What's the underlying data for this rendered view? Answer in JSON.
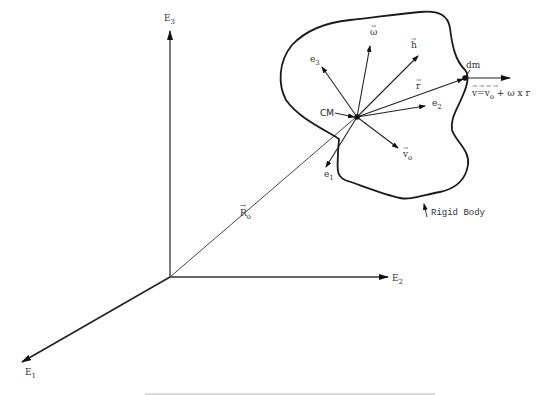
{
  "diagram": {
    "type": "rigid-body-kinematics",
    "axes": {
      "E1": {
        "label": "E",
        "sub": "1"
      },
      "E2": {
        "label": "E",
        "sub": "2"
      },
      "E3": {
        "label": "E",
        "sub": "3"
      }
    },
    "position_vector": {
      "label": "R",
      "sub": "o"
    },
    "center_of_mass": {
      "label": "CM"
    },
    "body_axes": {
      "e1": {
        "label": "e",
        "sub": "1"
      },
      "e2": {
        "label": "e",
        "sub": "2"
      },
      "e3": {
        "label": "e",
        "sub": "3"
      }
    },
    "vectors": {
      "omega": {
        "label": "ω"
      },
      "h": {
        "label": "h"
      },
      "r": {
        "label": "r"
      },
      "v_o": {
        "label": "v",
        "sub": "o"
      }
    },
    "mass_element": {
      "label": "dm"
    },
    "velocity_equation": {
      "lhs": "v",
      "eq": "=",
      "v0": "v",
      "v0_sub": "o",
      "plus": "+",
      "omega": "ω",
      "cross": "x",
      "r": "r"
    },
    "body_label": "Rigid Body",
    "colors": {
      "line": "#222222",
      "text": "#333333",
      "background": "#ffffff"
    }
  }
}
